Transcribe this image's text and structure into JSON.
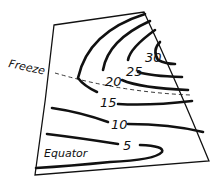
{
  "diagram": {
    "type": "isotherm-contour-sketch",
    "labels": {
      "freeze": "Freeze",
      "equator": "Equator"
    },
    "contours": [
      {
        "value": "5",
        "label": "5"
      },
      {
        "value": "10",
        "label": "10"
      },
      {
        "value": "15",
        "label": "15"
      },
      {
        "value": "20",
        "label": "20"
      },
      {
        "value": "25",
        "label": "25"
      },
      {
        "value": "30",
        "label": "30"
      }
    ],
    "colors": {
      "ink": "#111111",
      "background": "#ffffff"
    }
  }
}
